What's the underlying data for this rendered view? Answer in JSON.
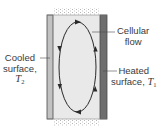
{
  "diagram": {
    "type": "natural-convection-enclosure",
    "labels": {
      "cellular_flow": {
        "line1": "Cellular",
        "line2": "flow"
      },
      "heated_surface": {
        "line1": "Heated",
        "line2_text": "surface, ",
        "symbol": "T",
        "subscript": "1"
      },
      "cooled_surface": {
        "line1": "Cooled",
        "line2": "surface,",
        "symbol": "T",
        "subscript": "2"
      }
    },
    "flow_direction": "clockwise",
    "colors": {
      "interior": "#e9e9e9",
      "cooled_wall": "#c2c2c2",
      "heated_wall": "#6e6e6e",
      "outline": "#4a4a4a",
      "flow_line": "#2a2a2a",
      "insulation_stipple": "#b5b5b5"
    }
  }
}
